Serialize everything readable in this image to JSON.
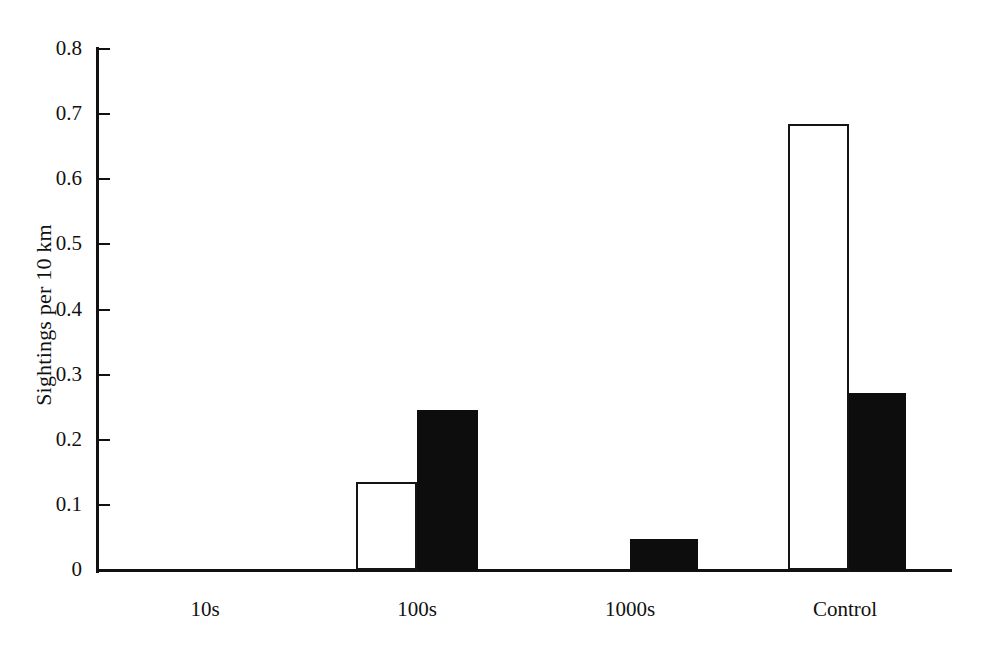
{
  "chart_data": {
    "type": "bar",
    "title": "",
    "subtitle": "",
    "xlabel": "",
    "ylabel": "Sightings per 10 km",
    "categories": [
      "10s",
      "100s",
      "1000s",
      "Control"
    ],
    "series": [
      {
        "name": "open",
        "style": "white-outline",
        "values": [
          0,
          0.135,
          0,
          0.685
        ]
      },
      {
        "name": "filled",
        "style": "black-solid",
        "values": [
          0,
          0.245,
          0.048,
          0.272
        ]
      }
    ],
    "ylim": [
      0,
      0.8
    ],
    "ytick_labels": [
      "0.8",
      "0.7",
      "0.6",
      "0.5",
      "0.4",
      "0.3",
      "0.2",
      "0.1",
      "0"
    ],
    "ytick_values": [
      0.8,
      0.7,
      0.6,
      0.5,
      0.4,
      0.3,
      0.2,
      0.1,
      0
    ],
    "grid": false,
    "legend": "none",
    "annotations": []
  },
  "axes": {
    "y_title": "Sightings per 10 km",
    "ticks": [
      {
        "label": "0.8",
        "value": 0.8
      },
      {
        "label": "0.7",
        "value": 0.7
      },
      {
        "label": "0.6",
        "value": 0.6
      },
      {
        "label": "0.5",
        "value": 0.5
      },
      {
        "label": "0.4",
        "value": 0.4
      },
      {
        "label": "0.3",
        "value": 0.3
      },
      {
        "label": "0.2",
        "value": 0.2
      },
      {
        "label": "0.1",
        "value": 0.1
      },
      {
        "label": "0",
        "value": 0
      }
    ],
    "categories": [
      {
        "label": "10s"
      },
      {
        "label": "100s"
      },
      {
        "label": "1000s"
      },
      {
        "label": "Control"
      }
    ]
  },
  "colors": {
    "axis": "#111111",
    "bar_filled": "#0d0d0d",
    "bar_open_fill": "#ffffff",
    "bar_open_stroke": "#141414",
    "background": "#ffffff"
  }
}
